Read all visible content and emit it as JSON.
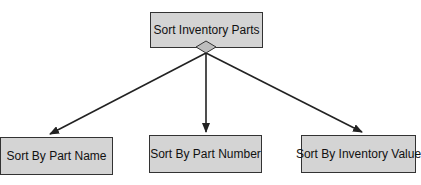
{
  "diagram": {
    "root": {
      "label": "Sort Inventory Parts"
    },
    "children": [
      {
        "label": "Sort By Part Name"
      },
      {
        "label": "Sort By Part Number"
      },
      {
        "label": "Sort By Inventory Value"
      }
    ],
    "colors": {
      "box_fill": "#d4d4d4",
      "border": "#333333",
      "line": "#222222"
    }
  }
}
